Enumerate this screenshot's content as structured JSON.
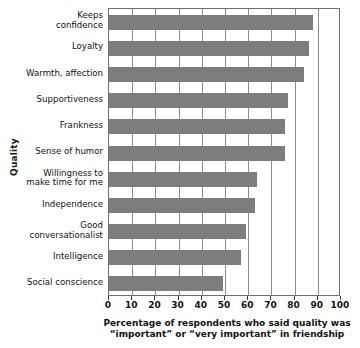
{
  "chart_data": {
    "type": "bar",
    "orientation": "horizontal",
    "title": "",
    "xlabel_line1": "Percentage of respondents who said quality was",
    "xlabel_line2": "“important” or “very important” in friendship",
    "ylabel": "Quality",
    "xlim": [
      0,
      100
    ],
    "xticks": [
      0,
      10,
      20,
      30,
      40,
      50,
      60,
      70,
      80,
      90,
      100
    ],
    "xtick_labels": [
      "0",
      "10",
      "20",
      "30",
      "40",
      "50",
      "60",
      "70",
      "80",
      "90",
      "100"
    ],
    "grid": true,
    "grid_axis": "x",
    "legend": "none",
    "bar_color": "#7d7d7d",
    "categories": [
      "Keeps\nconfidence",
      "Loyalty",
      "Warmth, affection",
      "Supportiveness",
      "Frankness",
      "Sense of humor",
      "Willingness to\nmake time for me",
      "Independence",
      "Good\nconversationalist",
      "Intelligence",
      "Social conscience"
    ],
    "values": [
      88,
      86,
      84,
      77,
      76,
      76,
      64,
      63,
      59,
      57,
      49
    ]
  }
}
